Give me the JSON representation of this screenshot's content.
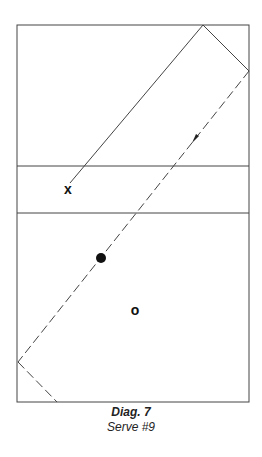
{
  "diagram": {
    "markers": {
      "player_x": "x",
      "player_o": "o"
    },
    "caption": {
      "title": "Diag. 7",
      "subtitle": "Serve #9"
    },
    "colors": {
      "line": "#333333",
      "background": "#ffffff"
    }
  }
}
